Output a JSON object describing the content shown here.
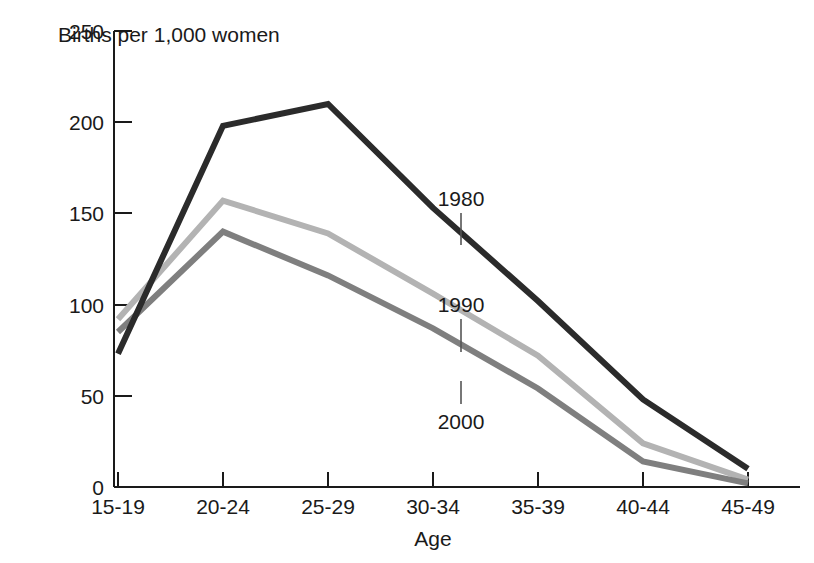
{
  "chart_data": {
    "type": "line",
    "title": "Births per 1,000 women",
    "xlabel": "Age",
    "ylabel": "",
    "categories": [
      "15-19",
      "20-24",
      "25-29",
      "30-34",
      "35-39",
      "40-44",
      "45-49"
    ],
    "ylim": [
      0,
      250
    ],
    "yticks": [
      0,
      50,
      100,
      150,
      200,
      250
    ],
    "ytick_labels": [
      "0",
      "50",
      "100",
      "150",
      "200",
      "250"
    ],
    "grid": false,
    "legend": "inline-labels",
    "series": [
      {
        "name": "1980",
        "color": "#2b2b2b",
        "values": [
          73,
          198,
          210,
          153,
          102,
          48,
          10
        ]
      },
      {
        "name": "1990",
        "color": "#b3b3b3",
        "values": [
          92,
          157,
          139,
          106,
          72,
          24,
          4
        ]
      },
      {
        "name": "2000",
        "color": "#7f7f7f",
        "values": [
          85,
          140,
          116,
          87,
          54,
          14,
          2
        ]
      }
    ],
    "annotations": [
      {
        "text": "1980",
        "series": "1980"
      },
      {
        "text": "1990",
        "series": "1990"
      },
      {
        "text": "2000",
        "series": "2000"
      }
    ]
  },
  "axis": {
    "y_labels": [
      "250",
      "200",
      "150",
      "100",
      "50",
      "0"
    ],
    "x_labels": [
      "15-19",
      "20-24",
      "25-29",
      "30-34",
      "35-39",
      "40-44",
      "45-49"
    ],
    "x_title": "Age",
    "y_title": "Births per 1,000 women"
  },
  "colors": {
    "axis": "#1a1a1a",
    "series_1980": "#2b2b2b",
    "series_1990": "#b3b3b3",
    "series_2000": "#7f7f7f",
    "background": "#ffffff"
  }
}
